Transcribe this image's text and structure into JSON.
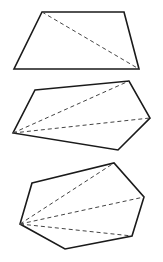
{
  "figure": {
    "stroke_color": "#1a1a1a",
    "diagonal_color": "#444444",
    "shapes": [
      {
        "name": "quadrilateral",
        "sides": 4,
        "vertices": [
          [
            42,
            12
          ],
          [
            124,
            12
          ],
          [
            139,
            69
          ],
          [
            14,
            69
          ]
        ],
        "diagonal_origin": [
          42,
          12
        ],
        "diagonals": [
          [
            [
              42,
              12
            ],
            [
              139,
              69
            ]
          ]
        ]
      },
      {
        "name": "pentagon",
        "sides": 5,
        "vertices": [
          [
            35,
            90
          ],
          [
            129,
            81
          ],
          [
            150,
            118
          ],
          [
            118,
            150
          ],
          [
            13,
            133
          ]
        ],
        "diagonal_origin": [
          13,
          133
        ],
        "diagonals": [
          [
            [
              13,
              133
            ],
            [
              129,
              81
            ]
          ],
          [
            [
              13,
              133
            ],
            [
              150,
              118
            ]
          ]
        ]
      },
      {
        "name": "hexagon",
        "sides": 6,
        "vertices": [
          [
            32,
            183
          ],
          [
            114,
            163
          ],
          [
            144,
            197
          ],
          [
            132,
            236
          ],
          [
            65,
            249
          ],
          [
            20,
            224
          ]
        ],
        "diagonal_origin": [
          20,
          224
        ],
        "diagonals": [
          [
            [
              20,
              224
            ],
            [
              114,
              163
            ]
          ],
          [
            [
              20,
              224
            ],
            [
              144,
              197
            ]
          ],
          [
            [
              20,
              224
            ],
            [
              132,
              236
            ]
          ]
        ]
      }
    ]
  },
  "caption": ""
}
